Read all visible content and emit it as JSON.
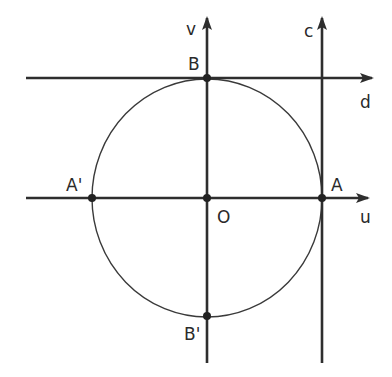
{
  "diagram": {
    "title": "",
    "center": {
      "label": "O",
      "x": 207,
      "y": 198
    },
    "circle": {
      "rx": 115,
      "ry": 119,
      "stroke": "#3a3a3a"
    },
    "axes": {
      "u": {
        "label": "u"
      },
      "v": {
        "label": "v"
      }
    },
    "lines": {
      "c": {
        "label": "c",
        "desc": "vertical tangent line through A"
      },
      "d": {
        "label": "d",
        "desc": "horizontal tangent line through B"
      }
    },
    "points": [
      {
        "label": "A",
        "x": 322,
        "y": 198
      },
      {
        "label": "A'",
        "x": 92,
        "y": 198
      },
      {
        "label": "B",
        "x": 207,
        "y": 78
      },
      {
        "label": "B'",
        "x": 207,
        "y": 316
      },
      {
        "label": "O",
        "x": 207,
        "y": 198
      }
    ],
    "colors": {
      "line": "#2e2e2e",
      "circle": "#3a3a3a",
      "text": "#2a2a2a"
    }
  }
}
